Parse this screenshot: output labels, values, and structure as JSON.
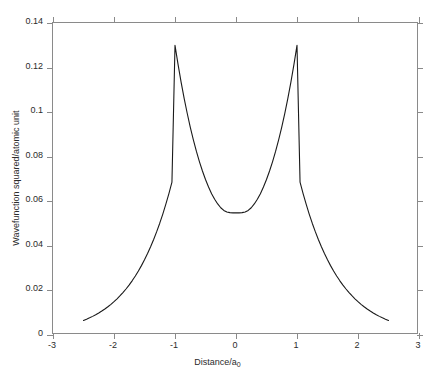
{
  "chart_data": {
    "type": "line",
    "title": "",
    "xlabel": "Distance/a",
    "xlabel_sub": "0",
    "xlabel_full": "Distance/a0",
    "ylabel": "Wavefunction squared/atomic unit",
    "xlim": [
      -3,
      3
    ],
    "ylim": [
      0,
      0.14
    ],
    "xticks": [
      -3,
      -2,
      -1,
      0,
      1,
      2,
      3
    ],
    "xticklabels": [
      "-3",
      "-2",
      "-1",
      "0",
      "1",
      "2",
      "3"
    ],
    "yticks": [
      0,
      0.02,
      0.04,
      0.06,
      0.08,
      0.1,
      0.12,
      0.14
    ],
    "yticklabels": [
      "0",
      "0.02",
      "0.04",
      "0.06",
      "0.08",
      "0.1",
      "0.12",
      "0.14"
    ],
    "grid": false,
    "legend": null,
    "line_color": "#1a1a1a",
    "line_width": 1.1,
    "axis_color": "#8a8a8a",
    "background": "#ffffff",
    "series": [
      {
        "name": "wavefunction squared",
        "x": [
          -2.5,
          -2.45,
          -2.4,
          -2.35,
          -2.3,
          -2.25,
          -2.2,
          -2.15,
          -2.1,
          -2.05,
          -2.0,
          -1.95,
          -1.9,
          -1.85,
          -1.8,
          -1.75,
          -1.7,
          -1.65,
          -1.6,
          -1.55,
          -1.5,
          -1.45,
          -1.4,
          -1.35,
          -1.3,
          -1.25,
          -1.2,
          -1.15,
          -1.1,
          -1.05,
          -1.0,
          -0.95,
          -0.9,
          -0.85,
          -0.8,
          -0.75,
          -0.7,
          -0.65,
          -0.6,
          -0.55,
          -0.5,
          -0.45,
          -0.4,
          -0.35,
          -0.3,
          -0.25,
          -0.2,
          -0.15,
          -0.1,
          -0.05,
          0.0,
          0.05,
          0.1,
          0.15,
          0.2,
          0.25,
          0.3,
          0.35,
          0.4,
          0.45,
          0.5,
          0.55,
          0.6,
          0.65,
          0.7,
          0.75,
          0.8,
          0.85,
          0.9,
          0.95,
          1.0,
          1.05,
          1.1,
          1.15,
          1.2,
          1.25,
          1.3,
          1.35,
          1.4,
          1.45,
          1.5,
          1.55,
          1.6,
          1.65,
          1.7,
          1.75,
          1.8,
          1.85,
          1.9,
          1.95,
          2.0,
          2.05,
          2.1,
          2.15,
          2.2,
          2.25,
          2.3,
          2.35,
          2.4,
          2.45,
          2.5
        ],
        "y": [
          0.0065,
          0.00707,
          0.00769,
          0.00836,
          0.00909,
          0.00988,
          0.01074,
          0.01167,
          0.01268,
          0.01377,
          0.01496,
          0.01624,
          0.01763,
          0.01913,
          0.02076,
          0.02252,
          0.02443,
          0.02649,
          0.02872,
          0.03113,
          0.03373,
          0.03654,
          0.03957,
          0.04284,
          0.04637,
          0.05017,
          0.05427,
          0.05869,
          0.06345,
          0.06858,
          0.13,
          0.1214,
          0.1135,
          0.1062,
          0.0995,
          0.0933,
          0.0877,
          0.0825,
          0.0778,
          0.0736,
          0.0698,
          0.0664,
          0.0634,
          0.0609,
          0.0588,
          0.0571,
          0.0559,
          0.0552,
          0.0549,
          0.0548,
          0.0548,
          0.0548,
          0.0549,
          0.0552,
          0.0559,
          0.0571,
          0.0588,
          0.0609,
          0.0634,
          0.0664,
          0.0698,
          0.0736,
          0.0778,
          0.0825,
          0.0877,
          0.0933,
          0.0995,
          0.1062,
          0.1135,
          0.1214,
          0.13,
          0.06858,
          0.06345,
          0.05869,
          0.05427,
          0.05017,
          0.04637,
          0.04284,
          0.03957,
          0.03654,
          0.03373,
          0.03113,
          0.02872,
          0.02649,
          0.02443,
          0.02252,
          0.02076,
          0.01913,
          0.01763,
          0.01624,
          0.01496,
          0.01377,
          0.01268,
          0.01167,
          0.01074,
          0.00988,
          0.00909,
          0.00836,
          0.00769,
          0.00707,
          0.0065
        ],
        "peaks": [
          {
            "x": -1,
            "y": 0.13
          },
          {
            "x": 1,
            "y": 0.13
          }
        ],
        "minimum": {
          "x": 0,
          "y": 0.0548
        },
        "endpoints": [
          {
            "x": -2.5,
            "y": 0.0065
          },
          {
            "x": 2.5,
            "y": 0.0065
          }
        ]
      }
    ]
  }
}
